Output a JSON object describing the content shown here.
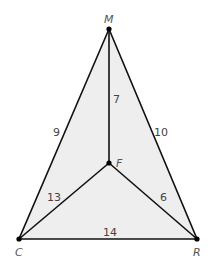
{
  "diagram": {
    "fill_color": "#eeeeee",
    "stroke_color": "#111111",
    "vertices": {
      "M": {
        "label": "M",
        "x": 109,
        "y": 29
      },
      "C": {
        "label": "C",
        "x": 19,
        "y": 239
      },
      "R": {
        "label": "R",
        "x": 197,
        "y": 239
      },
      "F": {
        "label": "F",
        "x": 109,
        "y": 163
      }
    },
    "edges": [
      {
        "from": "M",
        "to": "C",
        "length": "9"
      },
      {
        "from": "M",
        "to": "R",
        "length": "10"
      },
      {
        "from": "C",
        "to": "R",
        "length": "14"
      },
      {
        "from": "M",
        "to": "F",
        "length": "7"
      },
      {
        "from": "C",
        "to": "F",
        "length": "13"
      },
      {
        "from": "R",
        "to": "F",
        "length": "6"
      }
    ]
  }
}
